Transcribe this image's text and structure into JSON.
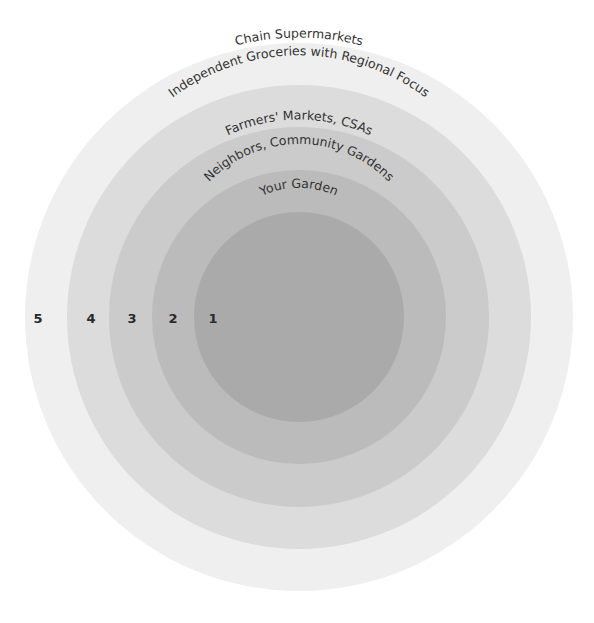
{
  "diagram": {
    "type": "concentric-circles",
    "rings": [
      {
        "number": "5",
        "label": "Chain Supermarkets",
        "color": "#efefef",
        "radius": 274
      },
      {
        "number": "4",
        "label": "Independent Groceries with Regional Focus",
        "color": "#dcdcdc",
        "radius": 232
      },
      {
        "number": "3",
        "label": "Farmers' Markets, CSAs",
        "color": "#cbcbcb",
        "radius": 190
      },
      {
        "number": "2",
        "label": "Neighbors, Community Gardens",
        "color": "#bbbbbb",
        "radius": 147
      },
      {
        "number": "1",
        "label": "Your Garden",
        "color": "#aaaaaa",
        "radius": 105
      }
    ]
  }
}
